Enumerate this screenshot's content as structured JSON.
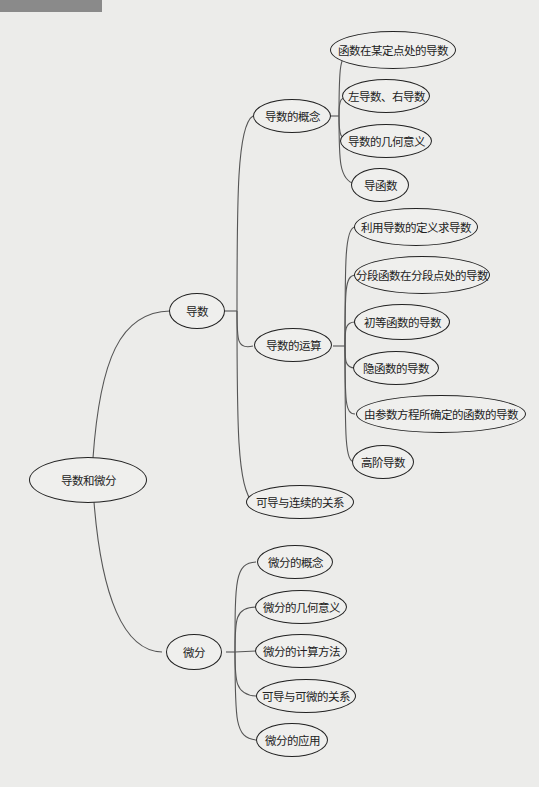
{
  "root": {
    "label": "导数和微分"
  },
  "branches": {
    "derivative": {
      "label": "导数",
      "children": {
        "concept": {
          "label": "导数的概念",
          "items": [
            "函数在某定点处的导数",
            "左导数、右导数",
            "导数的几何意义",
            "导函数"
          ]
        },
        "operations": {
          "label": "导数的运算",
          "items": [
            "利用导数的定义求导数",
            "分段函数在分段点处的导数",
            "初等函数的导数",
            "隐函数的导数",
            "由参数方程所确定的函数的导数",
            "高阶导数"
          ]
        },
        "continuity": {
          "label": "可导与连续的关系"
        }
      }
    },
    "differential": {
      "label": "微分",
      "items": [
        "微分的概念",
        "微分的几何意义",
        "微分的计算方法",
        "可导与可微的关系",
        "微分的应用"
      ]
    }
  },
  "colors": {
    "line": "#555555",
    "border": "#222222",
    "background": "#ececea"
  }
}
